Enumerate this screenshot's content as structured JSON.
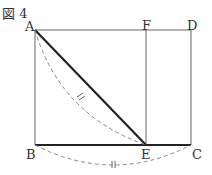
{
  "figure": {
    "title": "図 4",
    "points": {
      "A": "A",
      "B": "B",
      "C": "C",
      "D": "D",
      "E": "E",
      "F": "F"
    },
    "equal_mark": "⫲"
  }
}
